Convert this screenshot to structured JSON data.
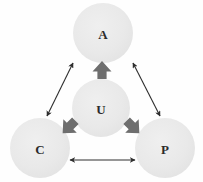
{
  "diagram": {
    "background_color": "#fefefe",
    "node_fill_color": "#e8e8e8",
    "node_label_color": "#2b2b2b",
    "thin_arrow_color": "#2e2e2e",
    "block_arrow_color": "#6e6e6e",
    "nodes": [
      {
        "id": "A",
        "label": "A",
        "cx": 103,
        "cy": 33,
        "r": 30
      },
      {
        "id": "U",
        "label": "U",
        "cx": 101,
        "cy": 108,
        "r": 29
      },
      {
        "id": "C",
        "label": "C",
        "cx": 40,
        "cy": 148,
        "r": 30
      },
      {
        "id": "P",
        "label": "P",
        "cx": 165,
        "cy": 148,
        "r": 30
      }
    ],
    "thin_arrows": [
      {
        "id": "c-a",
        "from": "C",
        "to": "A",
        "double_headed": true,
        "x1": 47,
        "y1": 116,
        "x2": 73,
        "y2": 63
      },
      {
        "id": "a-p",
        "from": "A",
        "to": "P",
        "double_headed": true,
        "x1": 133,
        "y1": 63,
        "x2": 160,
        "y2": 116
      },
      {
        "id": "c-p",
        "from": "C",
        "to": "P",
        "double_headed": true,
        "x1": 70,
        "y1": 160,
        "x2": 135,
        "y2": 160
      }
    ],
    "block_arrows": [
      {
        "id": "u-to-a",
        "from": "U",
        "to": "A",
        "direction": "up",
        "cx": 102,
        "cy": 70,
        "angle": 0
      },
      {
        "id": "u-to-c",
        "from": "U",
        "to": "C",
        "direction": "down-left",
        "cx": 69,
        "cy": 127,
        "angle": -135
      },
      {
        "id": "u-to-p",
        "from": "U",
        "to": "P",
        "direction": "down-right",
        "cx": 133,
        "cy": 127,
        "angle": 135
      }
    ]
  }
}
